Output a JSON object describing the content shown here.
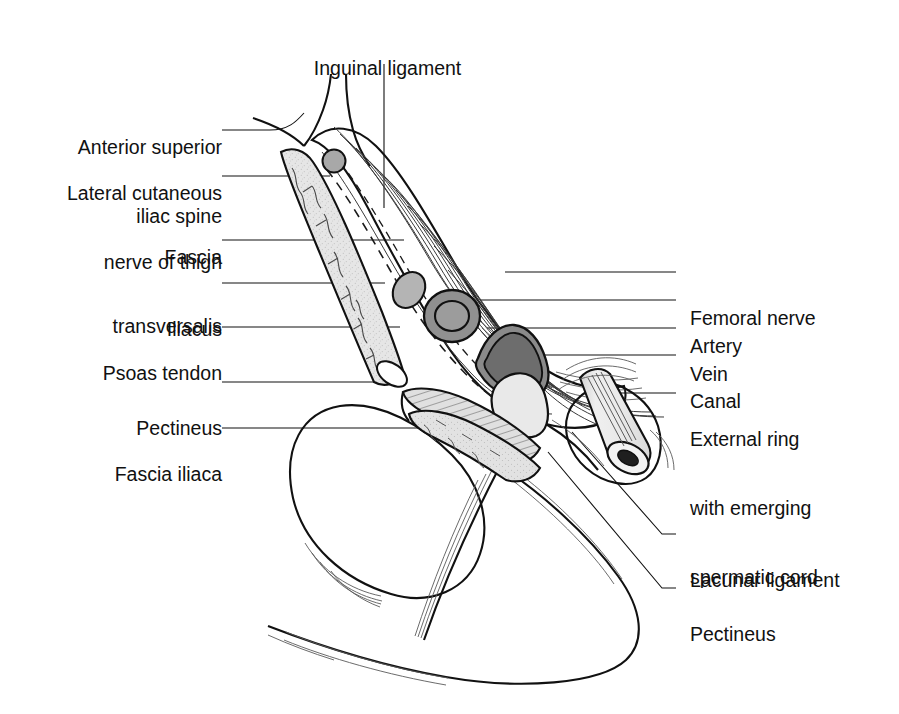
{
  "figure": {
    "type": "anatomical-line-diagram",
    "background_color": "#ffffff",
    "ink_color": "#111111"
  },
  "labels": {
    "top": [
      {
        "id": "inguinal-ligament",
        "text": "Inguinal ligament"
      }
    ],
    "left": [
      {
        "id": "anterior-superior-iliac-spine",
        "line1": "Anterior superior",
        "line2": "iliac spine"
      },
      {
        "id": "lateral-cutaneous-nerve-of-thigh",
        "line1": "Lateral cutaneous",
        "line2": "nerve of thigh"
      },
      {
        "id": "fascia-transversalis",
        "line1": "Fascia",
        "line2": "transversalis"
      },
      {
        "id": "iliacus",
        "line1": "Iliacus",
        "line2": ""
      },
      {
        "id": "psoas-tendon",
        "line1": "Psoas tendon",
        "line2": ""
      },
      {
        "id": "pectineus-left",
        "line1": "Pectineus",
        "line2": ""
      },
      {
        "id": "fascia-iliaca",
        "line1": "Fascia iliaca",
        "line2": ""
      }
    ],
    "right": [
      {
        "id": "femoral-nerve",
        "line1": "Femoral nerve",
        "line2": "",
        "line3": ""
      },
      {
        "id": "artery",
        "line1": "Artery",
        "line2": "",
        "line3": ""
      },
      {
        "id": "vein",
        "line1": "Vein",
        "line2": "",
        "line3": ""
      },
      {
        "id": "canal",
        "line1": "Canal",
        "line2": "",
        "line3": ""
      },
      {
        "id": "external-ring",
        "line1": "External ring",
        "line2": "with emerging",
        "line3": "spermatic cord"
      },
      {
        "id": "lacunar-ligament",
        "line1": "Lacunar ligament",
        "line2": "",
        "line3": ""
      },
      {
        "id": "pectineus-right",
        "line1": "Pectineus",
        "line2": "",
        "line3": ""
      }
    ]
  },
  "structures": {
    "iliacus_fill": "#e3e3e3",
    "nerve_fill": "#b4b4b4",
    "artery_wall": "#8f8f8f",
    "artery_lumen": "#9e9e9e",
    "vein_wall": "#8a8a8a",
    "vein_lumen": "#6e6e6e",
    "canal_fill": "#e8e8e8",
    "pectineus_fill": "#dcdcdc",
    "cord_fill": "#e8e8e8",
    "bone_fill": "#ffffff"
  }
}
